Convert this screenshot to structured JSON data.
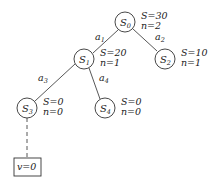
{
  "diagram": {
    "type": "search-tree",
    "nodes": [
      {
        "id": "S0",
        "label": "S",
        "sub": "0",
        "S": "S=30",
        "n": "n=2"
      },
      {
        "id": "S1",
        "label": "S",
        "sub": "1",
        "S": "S=20",
        "n": "n=1"
      },
      {
        "id": "S2",
        "label": "S",
        "sub": "2",
        "S": "S=10",
        "n": "n=1"
      },
      {
        "id": "S3",
        "label": "S",
        "sub": "3",
        "S": "S=0",
        "n": "n=0"
      },
      {
        "id": "S4",
        "label": "S",
        "sub": "4",
        "S": "S=0",
        "n": "n=0"
      }
    ],
    "edges": [
      {
        "from": "S0",
        "to": "S1",
        "label": "a",
        "sub": "1"
      },
      {
        "from": "S0",
        "to": "S2",
        "label": "a",
        "sub": "2"
      },
      {
        "from": "S1",
        "to": "S3",
        "label": "a",
        "sub": "3"
      },
      {
        "from": "S1",
        "to": "S4",
        "label": "a",
        "sub": "4"
      }
    ],
    "rollout": {
      "from": "S3",
      "style": "dashed",
      "leaf_label": "v=0"
    }
  }
}
